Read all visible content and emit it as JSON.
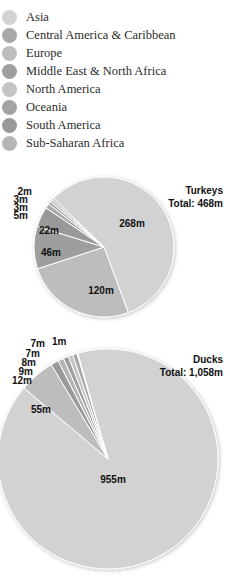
{
  "legend": [
    {
      "label": "Asia",
      "color": "#d2d2d2"
    },
    {
      "label": "Central America & Caribbean",
      "color": "#a8a8a8"
    },
    {
      "label": "Europe",
      "color": "#bdbdbd"
    },
    {
      "label": "Middle East & North Africa",
      "color": "#9e9e9e"
    },
    {
      "label": "North America",
      "color": "#c4c4c4"
    },
    {
      "label": "Oceania",
      "color": "#a3a3a3"
    },
    {
      "label": "South America",
      "color": "#999999"
    },
    {
      "label": "Sub-Saharan Africa",
      "color": "#b5b5b5"
    }
  ],
  "turkeys": {
    "title": "Turkeys",
    "total": "Total: 468m",
    "labels": [
      "268m",
      "120m",
      "46m",
      "22m",
      "5m",
      "3m",
      "3m",
      "2m"
    ]
  },
  "ducks": {
    "title": "Ducks",
    "total": "Total: 1,058m",
    "labels": [
      "955m",
      "55m",
      "12m",
      "9m",
      "8m",
      "7m",
      "7m",
      "1m"
    ]
  },
  "chart_data": [
    {
      "type": "pie",
      "title": "Turkeys",
      "subtitle": "Total: 468m",
      "unit": "millions",
      "categories": [
        "Asia",
        "Europe",
        "Middle East & North Africa",
        "South America",
        "Central America & Caribbean",
        "Oceania",
        "North America",
        "Sub-Saharan Africa"
      ],
      "values": [
        268,
        120,
        46,
        22,
        5,
        3,
        3,
        2
      ],
      "labels": [
        "268m",
        "120m",
        "46m",
        "22m",
        "5m",
        "3m",
        "3m",
        "2m"
      ],
      "legend_position": "top"
    },
    {
      "type": "pie",
      "title": "Ducks",
      "subtitle": "Total: 1,058m",
      "unit": "millions",
      "categories": [
        "Asia",
        "Europe",
        "South America",
        "Sub-Saharan Africa",
        "Middle East & North Africa",
        "North America",
        "Central America & Caribbean",
        "Oceania"
      ],
      "values": [
        955,
        55,
        12,
        9,
        8,
        7,
        7,
        1
      ],
      "labels": [
        "955m",
        "55m",
        "12m",
        "9m",
        "8m",
        "7m",
        "7m",
        "1m"
      ],
      "legend_position": "top"
    }
  ]
}
